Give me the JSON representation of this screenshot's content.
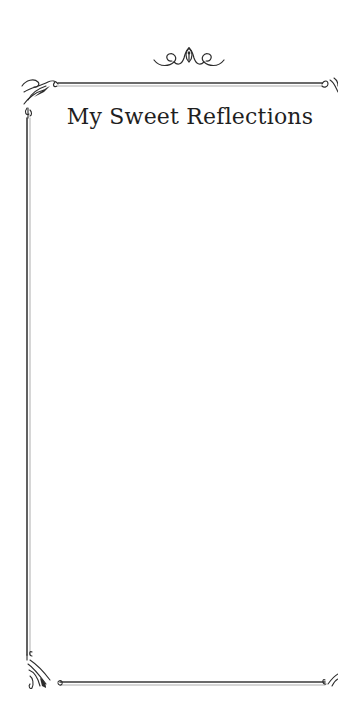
{
  "page": {
    "title": "My Sweet Reflections",
    "background_color": "#ffffff",
    "text_color": "#1f1f1f",
    "border_color": "#3a3a3a"
  },
  "ornaments": {
    "top": "flourish-icon",
    "corner_top_left": "corner-flourish-icon",
    "corner_top_right": "corner-flourish-icon",
    "corner_bottom_left": "corner-flourish-icon",
    "corner_bottom_right": "corner-flourish-icon"
  }
}
